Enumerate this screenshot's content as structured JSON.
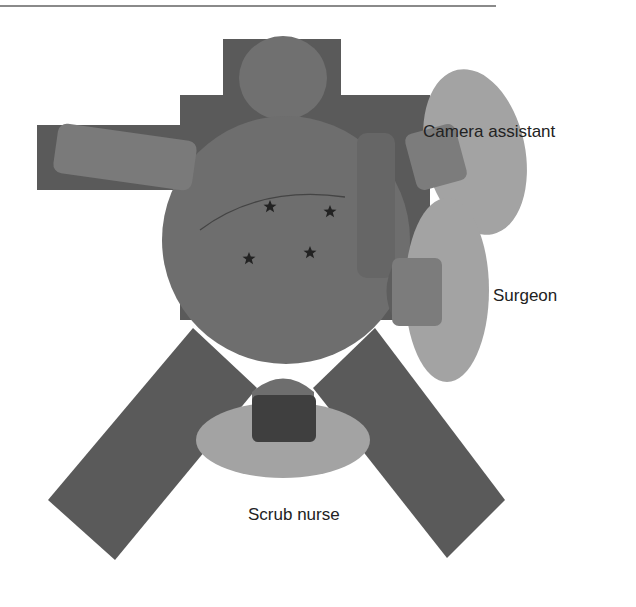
{
  "figure": {
    "type": "operating-room-layout",
    "labels": {
      "camera_assistant": "Camera assistant",
      "surgeon": "Surgeon",
      "scrub_nurse": "Scrub nurse"
    },
    "markers": {
      "count": 4,
      "shape": "star"
    },
    "colors": {
      "table": "#5a5a5a",
      "patient": "#6e6e6e",
      "staff_body": "#a3a3a3",
      "staff_head": "#7c7c7c",
      "nurse_head": "#3f3f3f",
      "marker": "#222222"
    }
  }
}
